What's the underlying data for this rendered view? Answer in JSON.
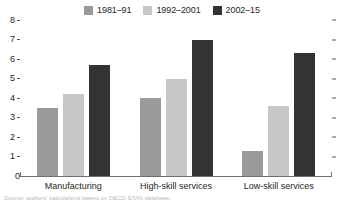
{
  "legend": {
    "position": "top-center",
    "entries": [
      {
        "label": "1981–91",
        "color": "#9a9a9a",
        "swatch_name": "legend-swatch-1981-91"
      },
      {
        "label": "1992–2001",
        "color": "#c6c6c6",
        "swatch_name": "legend-swatch-1992-2001"
      },
      {
        "label": "2002–15",
        "color": "#333333",
        "swatch_name": "legend-swatch-2002-15"
      }
    ]
  },
  "axis": {
    "y_ticks": [
      "8",
      "7",
      "6",
      "5",
      "4",
      "3",
      "2",
      "1",
      "0"
    ],
    "x_categories": [
      "Manufacturing",
      "High-skill services",
      "Low-skill services"
    ]
  },
  "footnote": {
    "text": "Source: authors' calculations based on OECD STAN database."
  },
  "chart_data": {
    "type": "bar",
    "title": "",
    "subtitle": "",
    "xlabel": "",
    "ylabel": "",
    "ylim": [
      0,
      8
    ],
    "yticks": [
      0,
      1,
      2,
      3,
      4,
      5,
      6,
      7,
      8
    ],
    "grid": false,
    "legend_position": "top-center",
    "categories": [
      "Manufacturing",
      "High-skill services",
      "Low-skill services"
    ],
    "series": [
      {
        "name": "1981–91",
        "color": "#9a9a9a",
        "values": [
          3.5,
          4.0,
          1.3
        ]
      },
      {
        "name": "1992–2001",
        "color": "#c6c6c6",
        "values": [
          4.2,
          5.0,
          3.6
        ]
      },
      {
        "name": "2002–15",
        "color": "#333333",
        "values": [
          5.7,
          7.0,
          6.3
        ]
      }
    ],
    "annotations": []
  }
}
